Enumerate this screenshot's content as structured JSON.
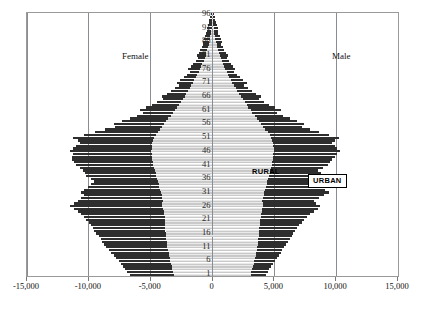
{
  "chart_data": {
    "type": "bar",
    "subtype": "population-pyramid",
    "title": "",
    "xlabel": "",
    "ylabel": "",
    "xlim": [
      -15000,
      15000
    ],
    "ylim": [
      1,
      96
    ],
    "grid": true,
    "orientation": "horizontal",
    "stacked": true,
    "legend_position": "inside-plot",
    "xticks": [
      -15000,
      -10000,
      -5000,
      0,
      5000,
      10000,
      15000
    ],
    "xticklabels": [
      "-15,000",
      "-10,000",
      "-5,000",
      "0",
      "5,000",
      "10,000",
      "15,000"
    ],
    "yticks": [
      1,
      6,
      11,
      16,
      21,
      26,
      31,
      36,
      41,
      46,
      51,
      56,
      61,
      66,
      71,
      76,
      81,
      86,
      91,
      96
    ],
    "yticklabels": [
      "1",
      "6",
      "11",
      "16",
      "21",
      "26",
      "31",
      "36",
      "41",
      "46",
      "51",
      "56",
      "61",
      "66",
      "71",
      "76",
      "81",
      "86",
      "91",
      "96"
    ],
    "side_labels": {
      "left": "Female",
      "right": "Male"
    },
    "series": [
      {
        "name": "RURAL",
        "color": "#c9c9c9",
        "label_style": "plain-text"
      },
      {
        "name": "URBAN",
        "color": "#2e2e2e",
        "label_style": "boxed-white"
      }
    ],
    "ages": [
      1,
      2,
      3,
      4,
      5,
      6,
      7,
      8,
      9,
      10,
      11,
      12,
      13,
      14,
      15,
      16,
      17,
      18,
      19,
      20,
      21,
      22,
      23,
      24,
      25,
      26,
      27,
      28,
      29,
      30,
      31,
      32,
      33,
      34,
      35,
      36,
      37,
      38,
      39,
      40,
      41,
      42,
      43,
      44,
      45,
      46,
      47,
      48,
      49,
      50,
      51,
      52,
      53,
      54,
      55,
      56,
      57,
      58,
      59,
      60,
      61,
      62,
      63,
      64,
      65,
      66,
      67,
      68,
      69,
      70,
      71,
      72,
      73,
      74,
      75,
      76,
      77,
      78,
      79,
      80,
      81,
      82,
      83,
      84,
      85,
      86,
      87,
      88,
      89,
      90,
      91,
      92,
      93,
      94,
      95,
      96
    ],
    "female_rural": [
      3150,
      3200,
      3250,
      3300,
      3380,
      3420,
      3460,
      3500,
      3550,
      3600,
      3640,
      3680,
      3700,
      3720,
      3750,
      3780,
      3800,
      3820,
      3830,
      3840,
      3860,
      3880,
      3900,
      3960,
      4020,
      4080,
      4050,
      4020,
      4060,
      4120,
      4180,
      4240,
      4300,
      4360,
      4420,
      4480,
      4540,
      4600,
      4660,
      4720,
      4790,
      4830,
      4860,
      4890,
      4920,
      4950,
      4930,
      4900,
      4860,
      4800,
      4760,
      4600,
      4420,
      4250,
      4080,
      3920,
      3740,
      3560,
      3380,
      3200,
      3050,
      2880,
      2720,
      2560,
      2400,
      2260,
      2120,
      1980,
      1840,
      1700,
      1580,
      1460,
      1340,
      1220,
      1110,
      1000,
      900,
      810,
      720,
      640,
      560,
      490,
      420,
      360,
      300,
      250,
      205,
      165,
      130,
      100,
      75,
      55,
      40,
      28,
      18,
      10
    ],
    "female_urban": [
      6700,
      6900,
      7050,
      7200,
      7400,
      7600,
      7800,
      8000,
      8200,
      8400,
      8600,
      8750,
      8900,
      9050,
      9200,
      9400,
      9550,
      9700,
      9850,
      10000,
      10200,
      10400,
      10600,
      10900,
      11200,
      11500,
      11200,
      10900,
      10600,
      10400,
      10650,
      10400,
      10100,
      9800,
      9550,
      9850,
      10200,
      10350,
      10500,
      10700,
      11000,
      11200,
      11400,
      11350,
      11300,
      11500,
      11250,
      11000,
      10750,
      10900,
      11300,
      10400,
      9500,
      8700,
      7900,
      8000,
      7300,
      6700,
      6100,
      5600,
      5900,
      5400,
      4900,
      4450,
      4000,
      4100,
      3700,
      3350,
      3000,
      2700,
      2900,
      2600,
      2330,
      2080,
      1850,
      1950,
      1740,
      1550,
      1370,
      1200,
      1280,
      1130,
      990,
      860,
      740,
      800,
      700,
      600,
      510,
      430,
      460,
      390,
      320,
      250,
      185,
      130
    ],
    "male_rural": [
      3100,
      3150,
      3200,
      3260,
      3320,
      3380,
      3430,
      3480,
      3520,
      3560,
      3600,
      3640,
      3670,
      3700,
      3730,
      3760,
      3780,
      3800,
      3820,
      3840,
      3870,
      3900,
      3930,
      3980,
      4040,
      4100,
      4070,
      4040,
      4080,
      4140,
      4200,
      4260,
      4320,
      4380,
      4440,
      4500,
      4560,
      4620,
      4680,
      4740,
      4800,
      4840,
      4870,
      4900,
      4930,
      4960,
      4940,
      4910,
      4870,
      4820,
      4770,
      4620,
      4450,
      4280,
      4110,
      3950,
      3770,
      3590,
      3410,
      3230,
      3080,
      2910,
      2750,
      2590,
      2430,
      2290,
      2150,
      2010,
      1870,
      1730,
      1610,
      1490,
      1370,
      1250,
      1140,
      1030,
      930,
      840,
      750,
      670,
      590,
      520,
      450,
      385,
      325,
      270,
      220,
      178,
      142,
      110,
      82,
      60,
      44,
      30,
      19,
      11
    ],
    "male_urban": [
      4300,
      4450,
      4600,
      4750,
      4900,
      5050,
      5200,
      5350,
      5500,
      5650,
      5800,
      5950,
      6100,
      6250,
      6400,
      6550,
      6700,
      6850,
      7000,
      7200,
      7400,
      7650,
      7900,
      8200,
      8500,
      8700,
      8400,
      8200,
      8600,
      9000,
      9400,
      9100,
      8800,
      8500,
      8200,
      8600,
      9000,
      8750,
      8500,
      8900,
      9300,
      9500,
      9700,
      9900,
      10100,
      10300,
      10100,
      9900,
      9700,
      9900,
      10200,
      9400,
      8600,
      7900,
      7200,
      7400,
      6800,
      6250,
      5700,
      5200,
      5500,
      5050,
      4600,
      4200,
      3800,
      3900,
      3520,
      3180,
      2860,
      2560,
      2750,
      2470,
      2210,
      1970,
      1750,
      1850,
      1650,
      1470,
      1300,
      1140,
      1220,
      1070,
      935,
      815,
      700,
      760,
      660,
      570,
      485,
      410,
      440,
      370,
      305,
      240,
      175,
      120
    ]
  }
}
